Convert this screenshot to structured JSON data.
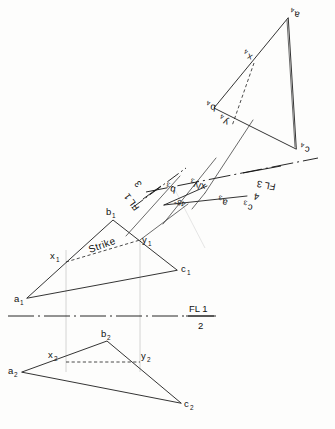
{
  "figure": {
    "background_color": "#fdfdfc",
    "ink_color": "#1d1d1d",
    "projector_color": "#c9c9c9"
  },
  "fold_lines": [
    {
      "id": "fl-1-2",
      "upper_text": "FL 1",
      "lower_text": "2",
      "orientation": "horizontal"
    },
    {
      "id": "fl-1-3",
      "upper_text": "FL 1",
      "lower_text": "3",
      "orientation": "oblique"
    },
    {
      "id": "fl-3-4",
      "upper_text": "FL 3",
      "lower_text": "4",
      "orientation": "oblique"
    }
  ],
  "annotations": {
    "strike_label": "Strike",
    "angle_label": "45°"
  },
  "views": {
    "view1": {
      "name": "top-view",
      "points": {
        "a": "a",
        "b": "b",
        "c": "c",
        "x": "x",
        "y": "y"
      },
      "index": "1"
    },
    "view2": {
      "name": "front-view",
      "points": {
        "a": "a",
        "b": "b",
        "c": "c",
        "x": "x",
        "y": "y"
      },
      "index": "2"
    },
    "view3": {
      "name": "edge-view",
      "points": {
        "a": "a",
        "b": "b",
        "c": "c",
        "xy": "x/y"
      },
      "index": "3"
    },
    "view4": {
      "name": "true-shape-view",
      "points": {
        "a": "a",
        "b": "b",
        "c": "c",
        "x": "x",
        "y": "y"
      },
      "index": "4"
    }
  }
}
